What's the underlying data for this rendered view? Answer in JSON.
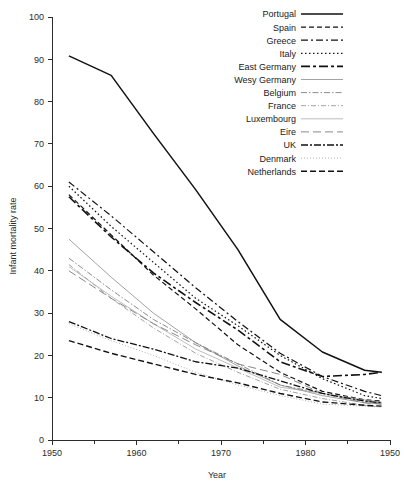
{
  "chart_data": {
    "type": "line",
    "title": "",
    "xlabel": "Year",
    "ylabel": "Infant mortality rate",
    "xlim": [
      1950,
      1990
    ],
    "ylim": [
      0,
      100
    ],
    "xticks": [
      1950,
      1960,
      1970,
      1980,
      1990
    ],
    "xtick_labels": [
      "1950",
      "1960",
      "1970",
      "1980",
      "1950"
    ],
    "yticks": [
      0,
      10,
      20,
      30,
      40,
      50,
      60,
      70,
      80,
      90,
      100
    ],
    "ytick_labels": [
      "0",
      "10",
      "20",
      "30",
      "40",
      "50",
      "60",
      "70",
      "80",
      "90",
      "100"
    ],
    "minor_xticks": [
      1955,
      1965,
      1975,
      1985
    ],
    "grid": false,
    "legend_position": "top-right",
    "x": [
      1952,
      1957,
      1962,
      1967,
      1972,
      1977,
      1982,
      1987,
      1989
    ],
    "series": [
      {
        "name": "Portugal",
        "label": "Portugal",
        "dash": "none",
        "dasharray": "0",
        "width": 1.5,
        "color": "#111111",
        "values": [
          90.8,
          86.2,
          72.5,
          59.2,
          45.0,
          28.5,
          20.8,
          16.5,
          16.0
        ]
      },
      {
        "name": "Spain",
        "label": "Spain",
        "dash": "dashed",
        "dasharray": "5,3",
        "width": 1.2,
        "color": "#111111",
        "values": [
          58.0,
          48.5,
          39.0,
          31.0,
          22.5,
          16.0,
          11.5,
          9.5,
          9.2
        ]
      },
      {
        "name": "Greece",
        "label": "Greece",
        "dash": "dash-dot",
        "dasharray": "7,3,2,3",
        "width": 1.2,
        "color": "#111111",
        "values": [
          61.0,
          53.0,
          44.5,
          36.0,
          28.0,
          20.5,
          15.0,
          11.5,
          10.5
        ]
      },
      {
        "name": "Italy",
        "label": "Italy",
        "dash": "dotted",
        "dasharray": "1.5,2.5",
        "width": 1.2,
        "color": "#111111",
        "values": [
          60.0,
          50.5,
          42.0,
          33.5,
          27.0,
          20.0,
          14.5,
          10.5,
          9.8
        ]
      },
      {
        "name": "East Germany",
        "label": "East Germany",
        "dash": "long-dash-dot",
        "dasharray": "9,3,3,3",
        "width": 1.6,
        "color": "#111111",
        "values": [
          57.5,
          48.0,
          39.5,
          32.5,
          26.0,
          18.5,
          15.0,
          15.5,
          16.0
        ]
      },
      {
        "name": "Wesy Germany",
        "label": "Wesy Germany",
        "dash": "solid-thin",
        "dasharray": "0",
        "width": 0.8,
        "color": "#8a8a8a",
        "values": [
          47.5,
          38.5,
          30.0,
          23.0,
          17.5,
          13.0,
          10.5,
          8.8,
          8.5
        ]
      },
      {
        "name": "Belgium",
        "label": "Belgium",
        "dash": "fine-dash-dot",
        "dasharray": "6,2,1.5,2",
        "width": 0.8,
        "color": "#6f6f6f",
        "values": [
          43.0,
          35.5,
          28.5,
          23.0,
          18.0,
          13.0,
          11.0,
          9.2,
          8.8
        ]
      },
      {
        "name": "France",
        "label": "France",
        "dash": "dash-dot-fine",
        "dasharray": "5,2,1,2",
        "width": 0.8,
        "color": "#8a8a8a",
        "values": [
          41.5,
          33.5,
          26.5,
          20.5,
          16.0,
          12.0,
          9.8,
          8.2,
          7.8
        ]
      },
      {
        "name": "Luxembourg",
        "label": "Luxembourg",
        "dash": "solid-light",
        "dasharray": "0",
        "width": 0.7,
        "color": "#a0a0a0",
        "values": [
          41.0,
          34.0,
          27.5,
          21.5,
          17.0,
          12.5,
          11.0,
          9.5,
          9.0
        ]
      },
      {
        "name": "Eire",
        "label": "Eire",
        "dash": "long-dash",
        "dasharray": "8,4",
        "width": 0.9,
        "color": "#7a7a7a",
        "values": [
          40.0,
          33.5,
          27.5,
          22.5,
          18.0,
          15.5,
          11.0,
          8.8,
          8.5
        ]
      },
      {
        "name": "UK",
        "label": "UK",
        "dash": "heavy-dash-dot",
        "dasharray": "7,2,2,2",
        "width": 1.3,
        "color": "#111111",
        "values": [
          28.0,
          24.0,
          21.5,
          18.5,
          17.0,
          14.0,
          11.0,
          9.2,
          8.8
        ]
      },
      {
        "name": "Denmark",
        "label": "Denmark",
        "dash": "fine-dot",
        "dasharray": "1,2",
        "width": 0.8,
        "color": "#9a9a9a",
        "values": [
          27.5,
          23.5,
          20.0,
          16.0,
          13.0,
          10.5,
          8.5,
          8.0,
          7.8
        ]
      },
      {
        "name": "Netherlands",
        "label": "Netherlands",
        "dash": "med-dash",
        "dasharray": "6,3",
        "width": 1.4,
        "color": "#111111",
        "values": [
          23.5,
          20.5,
          18.0,
          15.5,
          13.5,
          11.0,
          9.0,
          8.2,
          8.0
        ]
      }
    ]
  }
}
